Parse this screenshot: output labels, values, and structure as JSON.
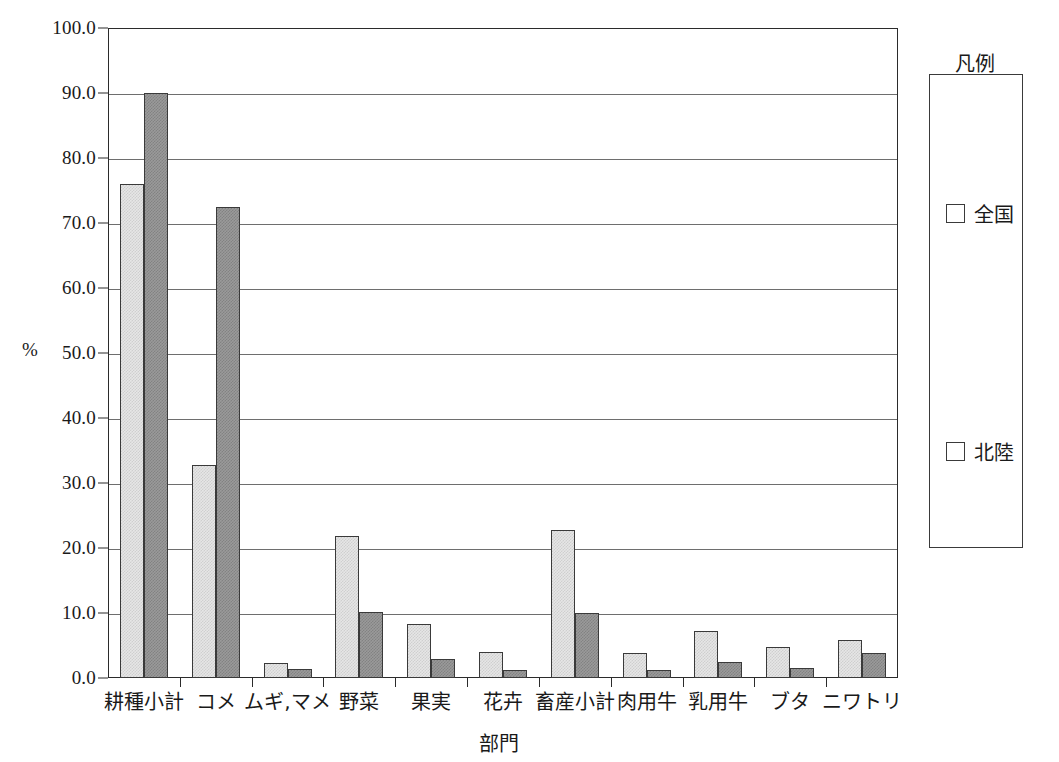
{
  "chart_data": {
    "type": "bar",
    "title": "",
    "xlabel": "部門",
    "ylabel": "%",
    "ylim": [
      0,
      100
    ],
    "ytick_step": 10,
    "ytick_labels": [
      "100.0",
      "90.0",
      "80.0",
      "70.0",
      "60.0",
      "50.0",
      "40.0",
      "30.0",
      "20.0",
      "10.0",
      "0.0"
    ],
    "grid": true,
    "legend_position": "right",
    "legend_title": "凡例",
    "categories": [
      "耕種小計",
      "コメ",
      "ムギ,マメ",
      "野菜",
      "果実",
      "花卉",
      "畜産小計",
      "肉用牛",
      "乳用牛",
      "ブタ",
      "ニワトリ"
    ],
    "series": [
      {
        "name": "北陸",
        "color": "#e6e6e6",
        "values": [
          76.0,
          32.8,
          2.3,
          21.9,
          8.3,
          4.0,
          22.8,
          3.9,
          7.2,
          4.8,
          5.9
        ]
      },
      {
        "name": "全国",
        "color": "#9a9a9a",
        "values": [
          90.0,
          72.5,
          1.4,
          10.1,
          2.9,
          1.3,
          10.0,
          1.2,
          2.5,
          1.6,
          3.9
        ]
      }
    ]
  },
  "legend": {
    "title": "凡例",
    "entries": [
      {
        "label": "全国",
        "swatch": "zenkoku"
      },
      {
        "label": "北陸",
        "swatch": "hokuriku"
      }
    ]
  },
  "axes": {
    "y_unit": "%",
    "x_title": "部門"
  }
}
